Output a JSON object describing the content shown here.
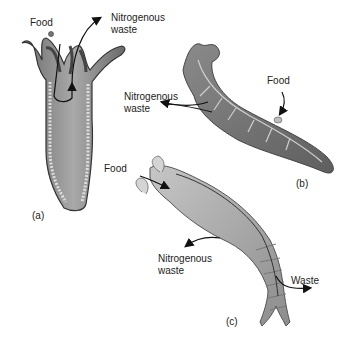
{
  "figure": {
    "panels": [
      {
        "id": "a",
        "label": "(a)",
        "organism": "hydra-like cnidarian",
        "annotations": {
          "food": "Food",
          "waste_line1": "Nitrogenous",
          "waste_line2": "waste"
        }
      },
      {
        "id": "b",
        "label": "(b)",
        "organism": "flatworm",
        "annotations": {
          "food": "Food",
          "waste_line1": "Nitrogenous",
          "waste_line2": "waste"
        }
      },
      {
        "id": "c",
        "label": "(c)",
        "organism": "segmented worm",
        "annotations": {
          "food": "Food",
          "waste_line1": "Nitrogenous",
          "waste_line2": "waste",
          "solid_waste": "Waste"
        }
      }
    ]
  }
}
